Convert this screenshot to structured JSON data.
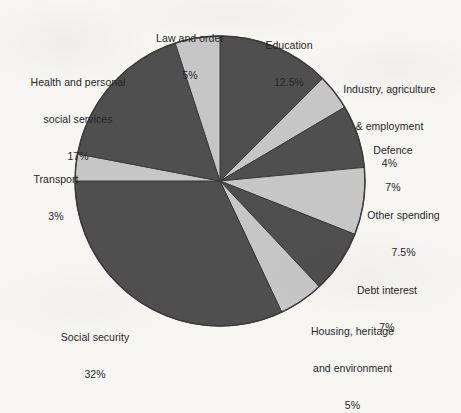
{
  "figure": {
    "background_color": "#f6f5f2",
    "text_color": "#262626"
  },
  "chart_data": {
    "type": "pie",
    "title": "",
    "subtitle": "",
    "xlabel": "",
    "ylabel": "",
    "legend_position": "none",
    "grid": false,
    "labels_position": "outside",
    "start_angle_deg": 0,
    "direction": "clockwise",
    "center": {
      "x": 220,
      "y": 181
    },
    "radius": 145,
    "colors": {
      "dark": "#4f4f4f",
      "light": "#c6c6c6",
      "outline": "#3a3a3a"
    },
    "categories": [
      "Education",
      "Industry, agriculture & employment",
      "Defence",
      "Other spending",
      "Debt interest",
      "Housing, heritage and environment",
      "Social security",
      "Transport",
      "Health and personal social services",
      "Law and order"
    ],
    "values": [
      12.5,
      4,
      7,
      7.5,
      7,
      5,
      32,
      3,
      17,
      5
    ],
    "total": 100,
    "unit": "%",
    "slices": [
      {
        "key": "education",
        "label_lines": [
          "Education"
        ],
        "value": 12.5,
        "value_text": "12.5%",
        "color": "#4f4f4f",
        "shade": "dark"
      },
      {
        "key": "industry-agriculture-employment",
        "label_lines": [
          "Industry, agriculture",
          "& employment"
        ],
        "value": 4,
        "value_text": "4%",
        "color": "#c6c6c6",
        "shade": "light"
      },
      {
        "key": "defence",
        "label_lines": [
          "Defence"
        ],
        "value": 7,
        "value_text": "7%",
        "color": "#4f4f4f",
        "shade": "dark"
      },
      {
        "key": "other-spending",
        "label_lines": [
          "Other spending"
        ],
        "value": 7.5,
        "value_text": "7.5%",
        "color": "#c6c6c6",
        "shade": "light"
      },
      {
        "key": "debt-interest",
        "label_lines": [
          "Debt interest"
        ],
        "value": 7,
        "value_text": "7%",
        "color": "#4f4f4f",
        "shade": "dark"
      },
      {
        "key": "housing-heritage-environment",
        "label_lines": [
          "Housing, heritage",
          "and environment"
        ],
        "value": 5,
        "value_text": "5%",
        "color": "#c6c6c6",
        "shade": "light"
      },
      {
        "key": "social-security",
        "label_lines": [
          "Social security"
        ],
        "value": 32,
        "value_text": "32%",
        "color": "#4f4f4f",
        "shade": "dark"
      },
      {
        "key": "transport",
        "label_lines": [
          "Transport"
        ],
        "value": 3,
        "value_text": "3%",
        "color": "#c6c6c6",
        "shade": "light"
      },
      {
        "key": "health-personal-social-services",
        "label_lines": [
          "Health and personal",
          "social services"
        ],
        "value": 17,
        "value_text": "17%",
        "color": "#4f4f4f",
        "shade": "dark"
      },
      {
        "key": "law-and-order",
        "label_lines": [
          "Law and order"
        ],
        "value": 5,
        "value_text": "5%",
        "color": "#c6c6c6",
        "shade": "light"
      }
    ]
  },
  "labels": {
    "education": {
      "name": "Education",
      "value": "12.5%"
    },
    "industry": {
      "line1": "Industry, agriculture",
      "line2": "& employment",
      "value": "4%"
    },
    "defence": {
      "name": "Defence",
      "value": "7%"
    },
    "other_spending": {
      "name": "Other spending",
      "value": "7.5%"
    },
    "debt_interest": {
      "name": "Debt interest",
      "value": "7%"
    },
    "housing": {
      "line1": "Housing, heritage",
      "line2": "and environment",
      "value": "5%"
    },
    "social_security": {
      "name": "Social security",
      "value": "32%"
    },
    "transport": {
      "name": "Transport",
      "value": "3%"
    },
    "health": {
      "line1": "Health and personal",
      "line2": "social services",
      "value": "17%"
    },
    "law_and_order": {
      "name": "Law and order",
      "value": "5%"
    }
  }
}
